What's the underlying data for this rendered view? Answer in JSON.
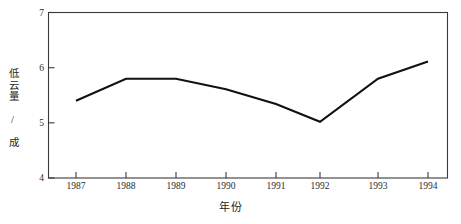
{
  "chart_data": {
    "type": "line",
    "title": "",
    "xlabel": "年份",
    "ylabel": "低云量 / 成",
    "categories": [
      "1987",
      "1988",
      "1989",
      "1990",
      "1991",
      "1992",
      "1993",
      "1994"
    ],
    "x": [
      1987,
      1988,
      1989,
      1990,
      1991,
      1992,
      1993,
      1994
    ],
    "values": [
      5.4,
      5.8,
      5.8,
      5.61,
      5.34,
      5.02,
      5.8,
      6.11
    ],
    "series": [
      {
        "name": "低云量",
        "values": [
          5.4,
          5.8,
          5.8,
          5.61,
          5.34,
          5.02,
          5.8,
          6.11
        ]
      }
    ],
    "xlim": [
      1986.4,
      1994.6
    ],
    "ylim": [
      4,
      7
    ],
    "yticks": [
      "4",
      "5",
      "6",
      "7"
    ],
    "ytick_values": [
      4,
      5,
      6,
      7
    ],
    "xticks": [
      "1987",
      "1988",
      "1989",
      "1990",
      "1991",
      "1992",
      "1993",
      "1994"
    ],
    "grid": false,
    "legend": "none",
    "line_color": "#111111",
    "axis_color": "#3a3a3a",
    "background": "#ffffff",
    "tick_direction": "in",
    "spines": [
      "left",
      "top",
      "right",
      "bottom"
    ]
  },
  "axis": {
    "y_title": "低云量 / 成",
    "x_title": "年份",
    "y_tick_0": "4",
    "y_tick_1": "5",
    "y_tick_2": "6",
    "y_tick_3": "7",
    "x_tick_0": "1987",
    "x_tick_1": "1988",
    "x_tick_2": "1989",
    "x_tick_3": "1990",
    "x_tick_4": "1991",
    "x_tick_5": "1992",
    "x_tick_6": "1993",
    "x_tick_7": "1994"
  }
}
